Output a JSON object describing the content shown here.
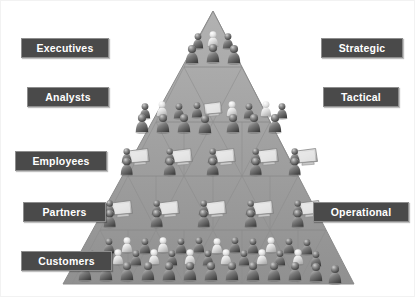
{
  "diagram": {
    "type": "pyramid",
    "background_color": "#ffffff",
    "pyramid_color": "#9b9b9b",
    "pyramid_edge_color": "#8a8a8a",
    "label_bg_color": "#4a4a4a",
    "label_text_color": "#ffffff",
    "label_border_color": "#8d8d8d"
  },
  "left_labels": [
    {
      "id": "executives",
      "label": "Executives",
      "x": 20,
      "y": 37,
      "width": 68
    },
    {
      "id": "analysts",
      "label": "Analysts",
      "x": 26,
      "y": 86,
      "width": 62
    },
    {
      "id": "employees",
      "label": "Employees",
      "x": 14,
      "y": 150,
      "width": 72
    },
    {
      "id": "partners",
      "label": "Partners",
      "x": 22,
      "y": 201,
      "width": 63
    },
    {
      "id": "customers",
      "label": "Customers",
      "x": 20,
      "y": 250,
      "width": 71
    }
  ],
  "right_labels": [
    {
      "id": "strategic",
      "x": 320,
      "y": 37,
      "label": "Strategic",
      "width": 62
    },
    {
      "id": "tactical",
      "x": 322,
      "y": 86,
      "label": "Tactical",
      "width": 56
    },
    {
      "id": "operational",
      "x": 312,
      "y": 201,
      "label": "Operational",
      "width": 76
    }
  ],
  "tiers": [
    {
      "id": "tier-1-executives",
      "people_count": 5,
      "has_monitors": false
    },
    {
      "id": "tier-2-analysts",
      "people_count": 11,
      "has_monitors": true
    },
    {
      "id": "tier-3-employees",
      "people_count": 5,
      "has_monitors": true
    },
    {
      "id": "tier-4-partners",
      "people_count": 5,
      "has_monitors": true
    },
    {
      "id": "tier-5-customers",
      "people_count": 34,
      "has_monitors": false
    }
  ]
}
